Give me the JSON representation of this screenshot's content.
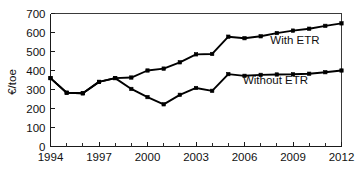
{
  "chart_data": {
    "type": "line",
    "title": "",
    "subtitle": "",
    "xlabel": "",
    "ylabel": "€/toe",
    "xlim": [
      1994,
      2012
    ],
    "ylim": [
      0,
      700
    ],
    "grid": false,
    "legend_position": "inline-annotation",
    "x": [
      1994,
      1995,
      1996,
      1997,
      1998,
      1999,
      2000,
      2001,
      2002,
      2003,
      2004,
      2005,
      2006,
      2007,
      2008,
      2009,
      2010,
      2011,
      2012
    ],
    "x_tick_labels": [
      "1994",
      "1997",
      "2000",
      "2003",
      "2006",
      "2009",
      "2012"
    ],
    "x_tick_values": [
      1994,
      1997,
      2000,
      2003,
      2006,
      2009,
      2012
    ],
    "x_minor_ticks": [
      1995,
      1996,
      1998,
      1999,
      2001,
      2002,
      2004,
      2005,
      2007,
      2008,
      2010,
      2011
    ],
    "y_tick_labels": [
      "0",
      "100",
      "200",
      "300",
      "400",
      "500",
      "600",
      "700"
    ],
    "y_tick_values": [
      0,
      100,
      200,
      300,
      400,
      500,
      600,
      700
    ],
    "series": [
      {
        "name": "With ETR",
        "label": "With ETR",
        "color": "#000000",
        "marker": "square",
        "values": [
          360,
          283,
          280,
          340,
          360,
          363,
          400,
          410,
          443,
          485,
          487,
          578,
          570,
          580,
          597,
          610,
          620,
          635,
          648
        ]
      },
      {
        "name": "Without ETR",
        "label": "Without ETR",
        "color": "#000000",
        "marker": "square",
        "values": [
          360,
          283,
          280,
          340,
          360,
          303,
          260,
          222,
          272,
          308,
          293,
          381,
          372,
          377,
          379,
          380,
          383,
          391,
          400
        ]
      }
    ],
    "annotations": [
      {
        "text": "With ETR",
        "x": 2007.6,
        "y": 540
      },
      {
        "text": "Without ETR",
        "x": 2005.9,
        "y": 330
      }
    ]
  },
  "colors": {
    "axis": "#1a1a1a",
    "frame": "#3a3a3a",
    "line": "#000000",
    "background": "#ffffff"
  }
}
